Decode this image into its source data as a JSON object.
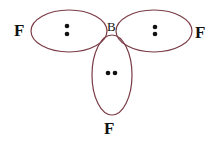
{
  "central_atom": {
    "symbol": "B"
  },
  "ligands": [
    {
      "id": "left",
      "symbol": "F",
      "lone_pair_orientation": "vertical"
    },
    {
      "id": "right",
      "symbol": "F",
      "lone_pair_orientation": "vertical"
    },
    {
      "id": "bottom",
      "symbol": "F",
      "lone_pair_orientation": "horizontal"
    }
  ],
  "electrons_per_orbital": 2,
  "colors": {
    "orbital_outline": "#7a3b45",
    "electron": "#111111",
    "text": "#111111",
    "background": "#ffffff"
  }
}
